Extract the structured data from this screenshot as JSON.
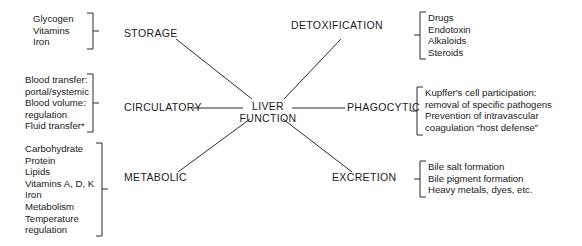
{
  "diagram": {
    "type": "concept-map",
    "title": "Liver Function",
    "center": {
      "line1": "LIVER",
      "line2": "FUNCTION"
    },
    "nodes": [
      {
        "id": "storage",
        "label": "STORAGE"
      },
      {
        "id": "detoxification",
        "label": "DETOXIFICATION"
      },
      {
        "id": "circulatory",
        "label": "CIRCULATORY"
      },
      {
        "id": "phagocytic",
        "label": "PHAGOCYTIC"
      },
      {
        "id": "metabolic",
        "label": "METABOLIC"
      },
      {
        "id": "excretion",
        "label": "EXCRETION"
      }
    ],
    "details": [
      {
        "id": "storage-details",
        "for": "storage",
        "bracket": "right",
        "items": [
          "Glycogen",
          "Vitamins",
          "Iron"
        ]
      },
      {
        "id": "circulatory-details",
        "for": "circulatory",
        "bracket": "right",
        "items": [
          "Blood transfer:",
          "portal/systemic",
          "Blood volume:",
          "regulation",
          "Fluid transfer*"
        ]
      },
      {
        "id": "metabolic-details",
        "for": "metabolic",
        "bracket": "right",
        "items": [
          "Carbohydrate",
          "Protein",
          "Lipids",
          "Vitamins A, D, K",
          "Iron",
          "Metabolism",
          "Temperature",
          "regulation"
        ]
      },
      {
        "id": "detoxification-details",
        "for": "detoxification",
        "bracket": "left",
        "items": [
          "Drugs",
          "Endotoxin",
          "Alkaloids",
          "Steroids"
        ]
      },
      {
        "id": "phagocytic-details",
        "for": "phagocytic",
        "bracket": "left",
        "items": [
          "Kupffer's cell participation:",
          "removal of specific pathogens",
          "Prevention of intravascular",
          "coagulation “host defense”"
        ]
      },
      {
        "id": "excretion-details",
        "for": "excretion",
        "bracket": "left",
        "items": [
          "Bile salt formation",
          "Bile pigment formation",
          "Heavy metals, dyes, etc."
        ]
      }
    ],
    "colors": {
      "line": "#2b2b2b",
      "text": "#1a1a1a",
      "background": "#ffffff"
    }
  }
}
